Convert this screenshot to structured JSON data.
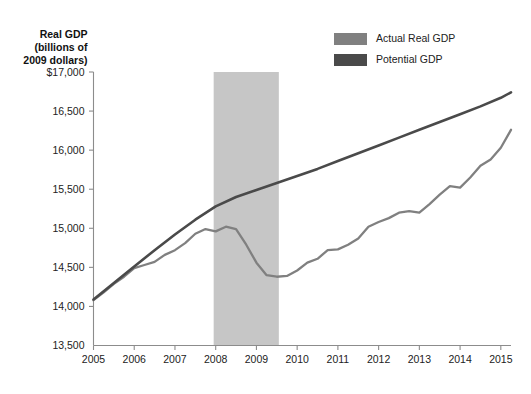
{
  "chart_data": {
    "type": "line",
    "title": "",
    "subtitle": "",
    "xlabel": "",
    "ylabel": "Real GDP (billions of 2009 dollars)",
    "ylabel_lines": [
      "Real GDP",
      "(billions of",
      "2009 dollars)"
    ],
    "grid": false,
    "legend_position": "top-right",
    "xlim": [
      2005.0,
      2015.25
    ],
    "ylim": [
      13500,
      17000
    ],
    "x_ticks": [
      2005,
      2006,
      2007,
      2008,
      2009,
      2010,
      2011,
      2012,
      2013,
      2014,
      2015
    ],
    "x_tick_labels": [
      "2005",
      "2006",
      "2007",
      "2008",
      "2009",
      "2010",
      "2011",
      "2012",
      "2013",
      "2014",
      "2015"
    ],
    "y_ticks": [
      13500,
      14000,
      14500,
      15000,
      15500,
      16000,
      16500,
      17000
    ],
    "y_tick_labels": [
      "13,500",
      "14,000",
      "14,500",
      "15,000",
      "15,500",
      "16,000",
      "16,500",
      "$17,000"
    ],
    "shaded_regions": [
      {
        "name": "recession-band",
        "x_start": 2007.95,
        "x_end": 2009.55,
        "y_top": 17000,
        "y_bottom": 13500,
        "color": "#c6c6c6"
      }
    ],
    "series": [
      {
        "name": "Actual Real GDP",
        "color": "#808080",
        "width": 2.3,
        "x": [
          2005.0,
          2005.25,
          2005.5,
          2005.75,
          2006.0,
          2006.25,
          2006.5,
          2006.75,
          2007.0,
          2007.25,
          2007.5,
          2007.75,
          2008.0,
          2008.25,
          2008.5,
          2008.75,
          2009.0,
          2009.25,
          2009.5,
          2009.75,
          2010.0,
          2010.25,
          2010.5,
          2010.75,
          2011.0,
          2011.25,
          2011.5,
          2011.75,
          2012.0,
          2012.25,
          2012.5,
          2012.75,
          2013.0,
          2013.25,
          2013.5,
          2013.75,
          2014.0,
          2014.25,
          2014.5,
          2014.75,
          2015.0,
          2015.25
        ],
        "values": [
          14080,
          14180,
          14290,
          14380,
          14490,
          14530,
          14570,
          14660,
          14720,
          14810,
          14930,
          14990,
          14960,
          15020,
          14990,
          14790,
          14560,
          14400,
          14380,
          14390,
          14460,
          14560,
          14610,
          14720,
          14730,
          14790,
          14870,
          15020,
          15080,
          15130,
          15200,
          15220,
          15200,
          15310,
          15430,
          15540,
          15520,
          15650,
          15800,
          15880,
          16030,
          16260
        ]
      },
      {
        "name": "Potential GDP",
        "color": "#4a4a4a",
        "width": 2.6,
        "x": [
          2005.0,
          2005.5,
          2006.0,
          2006.5,
          2007.0,
          2007.5,
          2008.0,
          2008.5,
          2009.0,
          2009.5,
          2010.0,
          2010.5,
          2011.0,
          2011.5,
          2012.0,
          2012.5,
          2013.0,
          2013.5,
          2014.0,
          2014.5,
          2015.0,
          2015.25
        ],
        "values": [
          14090,
          14300,
          14510,
          14720,
          14920,
          15110,
          15280,
          15400,
          15490,
          15580,
          15670,
          15760,
          15860,
          15960,
          16060,
          16160,
          16260,
          16360,
          16460,
          16560,
          16670,
          16740
        ]
      }
    ],
    "legend": [
      {
        "label": "Actual Real GDP",
        "color": "#808080"
      },
      {
        "label": "Potential GDP",
        "color": "#4a4a4a"
      }
    ],
    "annotations": []
  }
}
